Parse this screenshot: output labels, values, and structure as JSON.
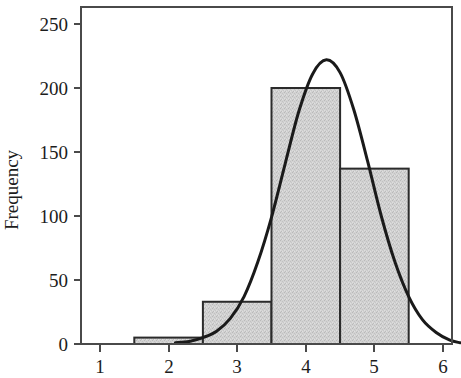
{
  "chart_data": {
    "type": "bar",
    "title": "",
    "subtitle": "",
    "xlabel": "",
    "ylabel": "Frequency",
    "xlim": [
      0.6,
      6.3
    ],
    "ylim": [
      0,
      262
    ],
    "grid": false,
    "legend": null,
    "bin_width": 1,
    "bin_edges": [
      1.5,
      2.5,
      3.5,
      4.5,
      5.5
    ],
    "categories": [
      "1.5-2.5",
      "2.5-3.5",
      "3.5-4.5",
      "4.5-5.5"
    ],
    "bin_centers": [
      2,
      3,
      4,
      5
    ],
    "values": [
      5,
      33,
      200,
      137
    ],
    "xticks": [
      1,
      2,
      3,
      4,
      5,
      6
    ],
    "xtick_labels": [
      "1",
      "2",
      "3",
      "4",
      "5",
      "6"
    ],
    "yticks": [
      0,
      50,
      100,
      150,
      200,
      250
    ],
    "ytick_labels": [
      "0",
      "50",
      "100",
      "150",
      "200",
      "250"
    ],
    "overlay": {
      "type": "line",
      "name": "normal density curve",
      "peak_x": 4.34,
      "peak_y": 223,
      "mean": 4.34,
      "sd": 0.66,
      "points_x": [
        2.1,
        2.3,
        2.5,
        2.7,
        2.9,
        3.1,
        3.3,
        3.5,
        3.7,
        3.9,
        4.1,
        4.3,
        4.5,
        4.7,
        4.9,
        5.1,
        5.3,
        5.5,
        5.7,
        5.9,
        6.1,
        6.25
      ],
      "points_y": [
        1,
        2,
        5,
        10,
        20,
        37,
        64,
        99,
        141,
        182,
        211,
        222,
        212,
        183,
        143,
        100,
        64,
        37,
        19,
        9,
        3,
        1
      ]
    },
    "style": {
      "bar_fill": "#cdcdcd",
      "bar_edge": "#2b2b2b",
      "curve_color": "#1a1a1a",
      "axis_color": "#4a4a4a",
      "background": "#ffffff"
    }
  },
  "axes": {
    "y_title": "Frequency"
  }
}
